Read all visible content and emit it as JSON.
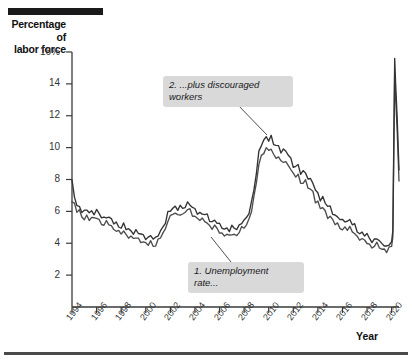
{
  "figure": {
    "y_axis_title_line1": "Percentage of",
    "y_axis_title_line2": "labor force",
    "x_axis_title": "Year"
  },
  "annotations": [
    {
      "id": "callout-2",
      "text": "2. ...plus discouraged\nworkers"
    },
    {
      "id": "callout-1",
      "text": "1. Unemployment\nrate..."
    }
  ],
  "chart_data": {
    "type": "line",
    "title": "",
    "xlabel": "Year",
    "ylabel": "Percentage of labor force",
    "xlim": [
      1994,
      2020.6
    ],
    "ylim": [
      0,
      16
    ],
    "grid": false,
    "legend": "none",
    "y_ticks": [
      "16%",
      "14",
      "12",
      "10",
      "8",
      "6",
      "4",
      "2"
    ],
    "y_tick_values": [
      16,
      14,
      12,
      10,
      8,
      6,
      4,
      2
    ],
    "x_ticks": [
      "1994",
      "1996",
      "1998",
      "2000",
      "2002",
      "2004",
      "2006",
      "2008",
      "2010",
      "2012",
      "2014",
      "2016",
      "2018",
      "2020"
    ],
    "x_tick_values": [
      1994,
      1996,
      1998,
      2000,
      2002,
      2004,
      2006,
      2008,
      2010,
      2012,
      2014,
      2016,
      2018,
      2020
    ],
    "series": [
      {
        "name": "1. Unemployment rate...",
        "color": "#4d4d4d",
        "x": [
          1994.0,
          1994.2,
          1994.4,
          1994.6,
          1994.8,
          1995.0,
          1995.2,
          1995.4,
          1995.6,
          1995.8,
          1996.0,
          1996.2,
          1996.4,
          1996.6,
          1996.8,
          1997.0,
          1997.2,
          1997.4,
          1997.6,
          1997.8,
          1998.0,
          1998.2,
          1998.4,
          1998.6,
          1998.8,
          1999.0,
          1999.2,
          1999.4,
          1999.6,
          1999.8,
          2000.0,
          2000.2,
          2000.4,
          2000.6,
          2000.8,
          2001.0,
          2001.2,
          2001.4,
          2001.6,
          2001.8,
          2002.0,
          2002.2,
          2002.4,
          2002.6,
          2002.8,
          2003.0,
          2003.2,
          2003.4,
          2003.6,
          2003.8,
          2004.0,
          2004.2,
          2004.4,
          2004.6,
          2004.8,
          2005.0,
          2005.2,
          2005.4,
          2005.6,
          2005.8,
          2006.0,
          2006.2,
          2006.4,
          2006.6,
          2006.8,
          2007.0,
          2007.2,
          2007.4,
          2007.6,
          2007.8,
          2008.0,
          2008.2,
          2008.4,
          2008.6,
          2008.8,
          2009.0,
          2009.2,
          2009.4,
          2009.6,
          2009.8,
          2010.0,
          2010.2,
          2010.4,
          2010.6,
          2010.8,
          2011.0,
          2011.2,
          2011.4,
          2011.6,
          2011.8,
          2012.0,
          2012.2,
          2012.4,
          2012.6,
          2012.8,
          2013.0,
          2013.2,
          2013.4,
          2013.6,
          2013.8,
          2014.0,
          2014.2,
          2014.4,
          2014.6,
          2014.8,
          2015.0,
          2015.2,
          2015.4,
          2015.6,
          2015.8,
          2016.0,
          2016.2,
          2016.4,
          2016.6,
          2016.8,
          2017.0,
          2017.2,
          2017.4,
          2017.6,
          2017.8,
          2018.0,
          2018.2,
          2018.4,
          2018.6,
          2018.8,
          2019.0,
          2019.2,
          2019.4,
          2019.6,
          2019.8,
          2020.0,
          2020.1,
          2020.25,
          2020.32,
          2020.45,
          2020.6
        ],
        "y": [
          6.6,
          6.5,
          6.1,
          6.0,
          5.6,
          5.5,
          5.7,
          5.6,
          5.6,
          5.5,
          5.6,
          5.4,
          5.3,
          5.2,
          5.3,
          5.2,
          5.0,
          4.9,
          4.9,
          4.7,
          4.6,
          4.7,
          4.5,
          4.5,
          4.4,
          4.3,
          4.3,
          4.2,
          4.2,
          4.1,
          4.0,
          3.9,
          4.0,
          3.9,
          3.9,
          4.2,
          4.4,
          4.5,
          4.9,
          5.5,
          5.7,
          5.9,
          5.8,
          5.7,
          5.9,
          5.8,
          6.0,
          6.1,
          6.0,
          5.8,
          5.7,
          5.6,
          5.5,
          5.4,
          5.4,
          5.3,
          5.1,
          5.0,
          5.0,
          4.9,
          4.7,
          4.6,
          4.6,
          4.5,
          4.4,
          4.6,
          4.5,
          4.6,
          4.7,
          4.9,
          5.0,
          5.1,
          5.6,
          6.1,
          6.8,
          7.8,
          8.9,
          9.5,
          9.8,
          9.9,
          9.8,
          9.9,
          9.5,
          9.5,
          9.4,
          9.1,
          9.1,
          9.0,
          9.0,
          8.7,
          8.3,
          8.2,
          8.2,
          7.8,
          7.9,
          7.9,
          7.5,
          7.3,
          7.2,
          6.7,
          6.6,
          6.2,
          6.2,
          5.9,
          5.7,
          5.7,
          5.5,
          5.2,
          5.1,
          5.0,
          4.9,
          5.0,
          4.9,
          4.9,
          4.7,
          4.7,
          4.4,
          4.3,
          4.2,
          4.1,
          4.1,
          3.9,
          3.8,
          3.8,
          3.9,
          3.8,
          3.6,
          3.7,
          3.5,
          3.6,
          3.8,
          4.4,
          14.7,
          13.2,
          11.1,
          7.9
        ]
      },
      {
        "name": "2. ...plus discouraged workers",
        "color": "#333333",
        "x": [
          1994.0,
          1994.2,
          1994.4,
          1994.6,
          1994.8,
          1995.0,
          1995.2,
          1995.4,
          1995.6,
          1995.8,
          1996.0,
          1996.2,
          1996.4,
          1996.6,
          1996.8,
          1997.0,
          1997.2,
          1997.4,
          1997.6,
          1997.8,
          1998.0,
          1998.2,
          1998.4,
          1998.6,
          1998.8,
          1999.0,
          1999.2,
          1999.4,
          1999.6,
          1999.8,
          2000.0,
          2000.2,
          2000.4,
          2000.6,
          2000.8,
          2001.0,
          2001.2,
          2001.4,
          2001.6,
          2001.8,
          2002.0,
          2002.2,
          2002.4,
          2002.6,
          2002.8,
          2003.0,
          2003.2,
          2003.4,
          2003.6,
          2003.8,
          2004.0,
          2004.2,
          2004.4,
          2004.6,
          2004.8,
          2005.0,
          2005.2,
          2005.4,
          2005.6,
          2005.8,
          2006.0,
          2006.2,
          2006.4,
          2006.6,
          2006.8,
          2007.0,
          2007.2,
          2007.4,
          2007.6,
          2007.8,
          2008.0,
          2008.2,
          2008.4,
          2008.6,
          2008.8,
          2009.0,
          2009.2,
          2009.4,
          2009.6,
          2009.8,
          2010.0,
          2010.2,
          2010.4,
          2010.6,
          2010.8,
          2011.0,
          2011.2,
          2011.4,
          2011.6,
          2011.8,
          2012.0,
          2012.2,
          2012.4,
          2012.6,
          2012.8,
          2013.0,
          2013.2,
          2013.4,
          2013.6,
          2013.8,
          2014.0,
          2014.2,
          2014.4,
          2014.6,
          2014.8,
          2015.0,
          2015.2,
          2015.4,
          2015.6,
          2015.8,
          2016.0,
          2016.2,
          2016.4,
          2016.6,
          2016.8,
          2017.0,
          2017.2,
          2017.4,
          2017.6,
          2017.8,
          2018.0,
          2018.2,
          2018.4,
          2018.6,
          2018.8,
          2019.0,
          2019.2,
          2019.4,
          2019.6,
          2019.8,
          2020.0,
          2020.1,
          2020.25,
          2020.32,
          2020.45,
          2020.6
        ],
        "y": [
          7.8,
          7.0,
          6.4,
          6.3,
          6.0,
          5.9,
          6.1,
          6.0,
          6.0,
          5.9,
          6.0,
          5.8,
          5.7,
          5.6,
          5.7,
          5.6,
          5.4,
          5.3,
          5.3,
          5.1,
          5.0,
          5.1,
          4.9,
          4.9,
          4.8,
          4.7,
          4.7,
          4.6,
          4.6,
          4.5,
          4.4,
          4.3,
          4.4,
          4.3,
          4.3,
          4.6,
          4.8,
          4.9,
          5.3,
          5.9,
          6.1,
          6.3,
          6.2,
          6.1,
          6.3,
          6.2,
          6.4,
          6.5,
          6.4,
          6.2,
          6.1,
          6.0,
          5.9,
          5.8,
          5.8,
          5.7,
          5.5,
          5.4,
          5.4,
          5.3,
          5.1,
          5.0,
          5.0,
          4.9,
          4.8,
          5.0,
          4.9,
          5.0,
          5.1,
          5.3,
          5.4,
          5.5,
          6.0,
          6.6,
          7.4,
          8.4,
          9.6,
          10.2,
          10.5,
          10.7,
          10.5,
          10.6,
          10.2,
          10.2,
          10.1,
          9.8,
          9.8,
          9.7,
          9.6,
          9.3,
          8.9,
          8.8,
          8.8,
          8.4,
          8.5,
          8.5,
          8.1,
          7.9,
          7.8,
          7.3,
          7.2,
          6.8,
          6.8,
          6.5,
          6.3,
          6.3,
          6.0,
          5.7,
          5.6,
          5.5,
          5.4,
          5.5,
          5.4,
          5.4,
          5.2,
          5.1,
          4.8,
          4.7,
          4.6,
          4.5,
          4.5,
          4.3,
          4.2,
          4.2,
          4.3,
          4.1,
          3.9,
          4.0,
          3.8,
          3.9,
          4.1,
          4.8,
          15.6,
          14.1,
          11.9,
          8.6
        ]
      }
    ]
  }
}
